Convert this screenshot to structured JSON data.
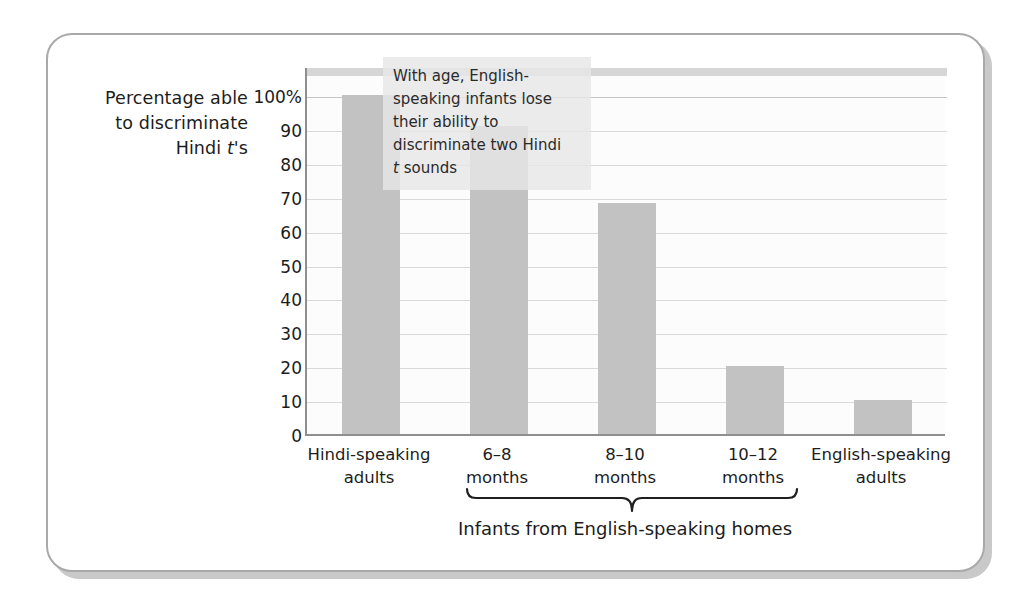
{
  "figure": {
    "y_axis_title_line1": "Percentage able",
    "y_axis_title_line2": "to discriminate",
    "y_axis_title_line3_pre": "Hindi ",
    "y_axis_title_line3_italic": "t",
    "y_axis_title_line3_post": "'s",
    "group_caption": "Infants from English-speaking homes",
    "annotation_line1": "With age, English-",
    "annotation_line2": "speaking infants lose",
    "annotation_line3": "their ability to",
    "annotation_line4": "discriminate two Hindi",
    "annotation_line5_italic": "t",
    "annotation_line5_post": " sounds"
  },
  "chart_data": {
    "type": "bar",
    "title": "",
    "xlabel": "Infants from English-speaking homes",
    "ylabel": "Percentage able to discriminate Hindi t's",
    "categories": [
      "Hindi-speaking adults",
      "6–08 months",
      "8–10 months",
      "10–12 months",
      "English-speaking adults"
    ],
    "category_lines": [
      [
        "Hindi-speaking",
        "adults"
      ],
      [
        "6–8",
        "months"
      ],
      [
        "8–10",
        "months"
      ],
      [
        "10–12",
        "months"
      ],
      [
        "English-speaking",
        "adults"
      ]
    ],
    "values": [
      100,
      91,
      68,
      20,
      10
    ],
    "ylim": [
      0,
      100
    ],
    "ytick_values": [
      100,
      90,
      80,
      70,
      60,
      50,
      40,
      30,
      20,
      10,
      0
    ],
    "ytick_labels": [
      "100%",
      "90",
      "80",
      "70",
      "60",
      "50",
      "40",
      "30",
      "20",
      "10",
      "0"
    ],
    "grid": true,
    "legend": "none",
    "annotations": [
      "With age, English-speaking infants lose their ability to discriminate two Hindi t sounds"
    ],
    "bracket_group": {
      "label": "Infants from English-speaking homes",
      "spans_categories": [
        "6–8 months",
        "8–10 months",
        "10–12 months"
      ]
    },
    "colors": {
      "bar": "#c2c2c2",
      "gridline": "#d9d9d9",
      "axis": "#8f8f8f",
      "frame": "#a9a9a9",
      "plot_background": "#fcfcfc",
      "annotation_background": "#e7e7e7",
      "text": "#1c1c1c"
    }
  }
}
